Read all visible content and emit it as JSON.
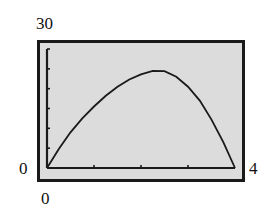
{
  "chart_data": {
    "type": "line",
    "title": "",
    "xlabel": "",
    "ylabel": "",
    "window": {
      "xmin": "0",
      "xmax": "4",
      "ymin": "0",
      "ymax": "30"
    },
    "xlim": [
      0,
      4
    ],
    "ylim": [
      0,
      30
    ],
    "x_ticks": [
      0,
      1,
      2,
      3,
      4
    ],
    "y_ticks": [
      0,
      5,
      10,
      15,
      20,
      25,
      30
    ],
    "grid": false,
    "legend": null,
    "series": [
      {
        "name": "graph",
        "x": [
          0,
          0.25,
          0.5,
          0.75,
          1.0,
          1.25,
          1.5,
          1.75,
          2.0,
          2.25,
          2.5,
          2.75,
          3.0,
          3.25,
          3.5,
          3.75,
          4.0
        ],
        "y": [
          0,
          4.8,
          9.0,
          12.5,
          15.5,
          18.2,
          20.5,
          22.3,
          23.6,
          24.5,
          24.4,
          23.0,
          20.5,
          17.0,
          12.2,
          6.5,
          0
        ]
      }
    ]
  },
  "colors": {
    "screen_bg": "#dcdcdc",
    "frame": "#1a1a1a",
    "curve": "#1a1a1a"
  }
}
